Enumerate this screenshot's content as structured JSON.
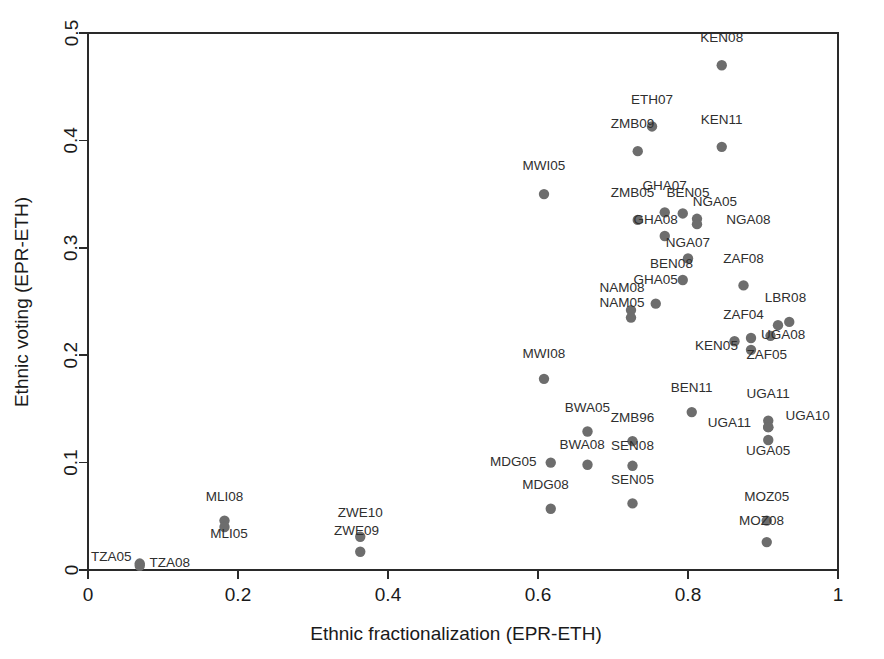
{
  "chart_data": {
    "type": "scatter",
    "title": "",
    "xlabel": "Ethnic fractionalization (EPR-ETH)",
    "ylabel": "Ethnic voting (EPR-ETH)",
    "xlim": [
      0,
      1
    ],
    "ylim": [
      0,
      0.5
    ],
    "xticks": [
      "0",
      "0.2",
      "0.4",
      "0.6",
      "0.8",
      "1"
    ],
    "xtick_values": [
      0,
      0.2,
      0.4,
      0.6,
      0.8,
      1
    ],
    "yticks": [
      "0",
      "0.1",
      "0.2",
      "0.3",
      "0.4",
      "0.5"
    ],
    "ytick_values": [
      0,
      0.1,
      0.2,
      0.3,
      0.4,
      0.5
    ],
    "grid": false,
    "legend": "none",
    "marker_color": "#6d6d6d",
    "points": [
      {
        "label": "KEN08",
        "x": 0.845,
        "y": 0.47,
        "lx": 0.845,
        "ly": 0.492,
        "anchor": "middle"
      },
      {
        "label": "ETH07",
        "x": 0.752,
        "y": 0.413,
        "lx": 0.752,
        "ly": 0.434,
        "anchor": "middle"
      },
      {
        "label": "KEN11",
        "x": 0.845,
        "y": 0.394,
        "lx": 0.845,
        "ly": 0.415,
        "anchor": "middle"
      },
      {
        "label": "ZMB09",
        "x": 0.733,
        "y": 0.39,
        "lx": 0.726,
        "ly": 0.412,
        "anchor": "middle"
      },
      {
        "label": "MWI05",
        "x": 0.608,
        "y": 0.35,
        "lx": 0.608,
        "ly": 0.372,
        "anchor": "middle"
      },
      {
        "label": "GHA07",
        "x": 0.769,
        "y": 0.333,
        "lx": 0.769,
        "ly": 0.354,
        "anchor": "middle"
      },
      {
        "label": "BEN05",
        "x": 0.793,
        "y": 0.332,
        "lx": 0.8,
        "ly": 0.347,
        "anchor": "middle"
      },
      {
        "label": "NGA05",
        "x": 0.812,
        "y": 0.327,
        "lx": 0.836,
        "ly": 0.339,
        "anchor": "middle"
      },
      {
        "label": "ZMB05",
        "x": 0.733,
        "y": 0.326,
        "lx": 0.726,
        "ly": 0.347,
        "anchor": "middle"
      },
      {
        "label": "NGA08",
        "x": 0.812,
        "y": 0.322,
        "lx": 0.851,
        "ly": 0.322,
        "anchor": "start"
      },
      {
        "label": "GHA08",
        "x": 0.769,
        "y": 0.311,
        "lx": 0.757,
        "ly": 0.322,
        "anchor": "middle"
      },
      {
        "label": "NGA07",
        "x": 0.8,
        "y": 0.29,
        "lx": 0.8,
        "ly": 0.301,
        "anchor": "middle"
      },
      {
        "label": "BEN08",
        "x": 0.793,
        "y": 0.27,
        "lx": 0.778,
        "ly": 0.281,
        "anchor": "middle"
      },
      {
        "label": "ZAF08",
        "x": 0.874,
        "y": 0.265,
        "lx": 0.874,
        "ly": 0.286,
        "anchor": "middle"
      },
      {
        "label": "GHA05",
        "x": 0.757,
        "y": 0.248,
        "lx": 0.757,
        "ly": 0.266,
        "anchor": "middle"
      },
      {
        "label": "NAM08",
        "x": 0.724,
        "y": 0.242,
        "lx": 0.712,
        "ly": 0.259,
        "anchor": "middle"
      },
      {
        "label": "NAM05",
        "x": 0.724,
        "y": 0.235,
        "lx": 0.712,
        "ly": 0.245,
        "anchor": "middle"
      },
      {
        "label": "LBR08",
        "x": 0.935,
        "y": 0.231,
        "lx": 0.93,
        "ly": 0.25,
        "anchor": "middle"
      },
      {
        "label": "LBR08b",
        "x": 0.92,
        "y": 0.228,
        "lx": null,
        "ly": null,
        "anchor": "middle"
      },
      {
        "label": "ZAF04",
        "x": 0.884,
        "y": 0.216,
        "lx": 0.874,
        "ly": 0.234,
        "anchor": "middle"
      },
      {
        "label": "UGA08",
        "x": 0.91,
        "y": 0.218,
        "lx": 0.927,
        "ly": 0.215,
        "anchor": "middle"
      },
      {
        "label": "KEN05",
        "x": 0.862,
        "y": 0.213,
        "lx": 0.838,
        "ly": 0.205,
        "anchor": "middle"
      },
      {
        "label": "ZAF05",
        "x": 0.884,
        "y": 0.205,
        "lx": 0.905,
        "ly": 0.196,
        "anchor": "middle"
      },
      {
        "label": "MWI08",
        "x": 0.608,
        "y": 0.178,
        "lx": 0.608,
        "ly": 0.197,
        "anchor": "middle"
      },
      {
        "label": "BEN11",
        "x": 0.805,
        "y": 0.147,
        "lx": 0.805,
        "ly": 0.166,
        "anchor": "middle"
      },
      {
        "label": "UGA11",
        "x": 0.907,
        "y": 0.139,
        "lx": 0.907,
        "ly": 0.16,
        "anchor": "middle"
      },
      {
        "label": "UGA10",
        "x": 0.907,
        "y": 0.133,
        "lx": 0.93,
        "ly": 0.14,
        "anchor": "start"
      },
      {
        "label": "UGA11b",
        "x": 0.907,
        "y": 0.133,
        "lx": 0.884,
        "ly": 0.133,
        "anchor": "end"
      },
      {
        "label": "BWA05",
        "x": 0.666,
        "y": 0.129,
        "lx": 0.666,
        "ly": 0.147,
        "anchor": "middle"
      },
      {
        "label": "ZMB96",
        "x": 0.726,
        "y": 0.12,
        "lx": 0.726,
        "ly": 0.138,
        "anchor": "middle"
      },
      {
        "label": "UGA05",
        "x": 0.907,
        "y": 0.121,
        "lx": 0.907,
        "ly": 0.107,
        "anchor": "middle"
      },
      {
        "label": "MDG05",
        "x": 0.617,
        "y": 0.1,
        "lx": 0.598,
        "ly": 0.097,
        "anchor": "end"
      },
      {
        "label": "BWA08",
        "x": 0.666,
        "y": 0.098,
        "lx": 0.659,
        "ly": 0.113,
        "anchor": "middle"
      },
      {
        "label": "SEN08",
        "x": 0.726,
        "y": 0.097,
        "lx": 0.726,
        "ly": 0.112,
        "anchor": "middle"
      },
      {
        "label": "SEN05",
        "x": 0.726,
        "y": 0.062,
        "lx": 0.726,
        "ly": 0.08,
        "anchor": "middle"
      },
      {
        "label": "MDG08",
        "x": 0.617,
        "y": 0.057,
        "lx": 0.61,
        "ly": 0.075,
        "anchor": "middle"
      },
      {
        "label": "MOZ05",
        "x": 0.905,
        "y": 0.046,
        "lx": 0.905,
        "ly": 0.064,
        "anchor": "middle"
      },
      {
        "label": "MOZ08",
        "x": 0.905,
        "y": 0.026,
        "lx": 0.898,
        "ly": 0.042,
        "anchor": "middle"
      },
      {
        "label": "MLI08",
        "x": 0.182,
        "y": 0.046,
        "lx": 0.182,
        "ly": 0.064,
        "anchor": "middle"
      },
      {
        "label": "MLI05",
        "x": 0.182,
        "y": 0.04,
        "lx": 0.188,
        "ly": 0.03,
        "anchor": "middle"
      },
      {
        "label": "ZWE10",
        "x": 0.363,
        "y": 0.031,
        "lx": 0.363,
        "ly": 0.049,
        "anchor": "middle"
      },
      {
        "label": "ZWE09",
        "x": 0.363,
        "y": 0.017,
        "lx": 0.358,
        "ly": 0.033,
        "anchor": "middle"
      },
      {
        "label": "TZA05",
        "x": 0.069,
        "y": 0.006,
        "lx": 0.058,
        "ly": 0.008,
        "anchor": "end"
      },
      {
        "label": "TZA08",
        "x": 0.069,
        "y": 0.004,
        "lx": 0.082,
        "ly": 0.003,
        "anchor": "start"
      }
    ]
  },
  "axes": {
    "x_title": "Ethnic fractionalization (EPR-ETH)",
    "y_title": "Ethnic voting (EPR-ETH)"
  }
}
